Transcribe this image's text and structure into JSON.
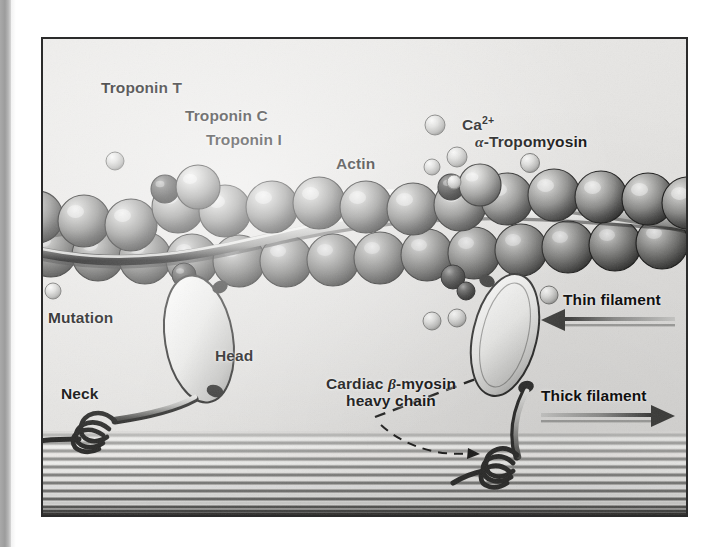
{
  "figure": {
    "frame": {
      "x": 41,
      "y": 37,
      "width": 643,
      "height": 476,
      "border_color": "#2b2b2b"
    },
    "background_color": "#e6e6e4",
    "ink_color": "#111111"
  },
  "labels": [
    {
      "id": "troponin-t",
      "text": "Troponin T",
      "x": 58,
      "y": 40,
      "leader": "vertical"
    },
    {
      "id": "troponin-c",
      "text": "Troponin C",
      "x": 142,
      "y": 68,
      "leader": "diagonal"
    },
    {
      "id": "troponin-i",
      "text": "Troponin I",
      "x": 163,
      "y": 92,
      "leader": "diagonal"
    },
    {
      "id": "actin",
      "text": "Actin",
      "x": 293,
      "y": 118,
      "leader": "vertical"
    },
    {
      "id": "calcium",
      "text": "Ca2+",
      "x": 405,
      "y": 78,
      "leader": "short-horizontal"
    },
    {
      "id": "tropomyosin",
      "text": "Tropomyosin",
      "x": 430,
      "y": 96,
      "leader": "vertical"
    },
    {
      "id": "mutation",
      "text": "Mutation",
      "x": 5,
      "y": 272,
      "leader": "two-branch"
    },
    {
      "id": "head",
      "text": "Head",
      "x": 165,
      "y": 310,
      "leader": "short-horizontal"
    },
    {
      "id": "neck",
      "text": "Neck",
      "x": 20,
      "y": 348,
      "leader": "diagonal"
    },
    {
      "id": "myosin-l1",
      "text": "Cardiac",
      "x": 290,
      "y": 340,
      "leader": "vertical"
    },
    {
      "id": "myosin-l2",
      "text": "heavy chain",
      "x": 290,
      "y": 360,
      "leader": "none"
    },
    {
      "id": "thin-filament",
      "text": "Thin filament",
      "x": 520,
      "y": 254,
      "leader": "arrow-left"
    },
    {
      "id": "thick-filament",
      "text": "Thick filament",
      "x": 520,
      "y": 352,
      "leader": "arrow-right"
    }
  ],
  "calcium": {
    "symbol": "Ca",
    "charge": "2+",
    "full_label": "Ca2+"
  },
  "tropomyosin": {
    "greek_prefix": "a",
    "greek_unicode": "α",
    "name": "Tropomyosin",
    "full_label": "α-Tropomyosin"
  },
  "myosin": {
    "greek_unicode": "β",
    "line1_pre": "Cardiac ",
    "line1_post": "-myosin",
    "line2": "heavy chain",
    "full_label": "Cardiac β-myosin heavy chain"
  },
  "filaments": {
    "thin": {
      "label": "Thin filament",
      "direction": "left"
    },
    "thick": {
      "label": "Thick filament",
      "direction": "right"
    }
  },
  "structures": {
    "actin_beads_top_count": 14,
    "actin_beads_bottom_count": 14,
    "troponin_complex_count": 2,
    "calcium_ion_count": 10,
    "myosin_head_count": 2,
    "thick_filament_stripe_count": 22
  }
}
